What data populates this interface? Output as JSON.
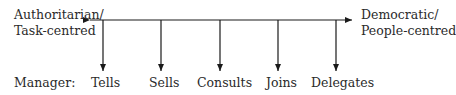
{
  "left_pole": {
    "line1": "Authoritarian/",
    "line2": "Task-centred"
  },
  "right_pole": {
    "line1": "Democratic/",
    "line2": "People-centred"
  },
  "row_label": "Manager:",
  "behaviours": [
    {
      "label": "Tells"
    },
    {
      "label": "Sells"
    },
    {
      "label": "Consults"
    },
    {
      "label": "Joins"
    },
    {
      "label": "Delegates"
    }
  ],
  "colors": {
    "line": "#1a1a1a",
    "text": "#2a2a2a"
  }
}
